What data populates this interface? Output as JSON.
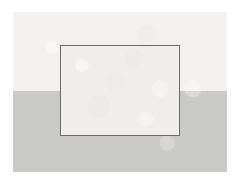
{
  "figure": {
    "canvas": {
      "width": 241,
      "height": 183,
      "background_color": "#ffffff"
    },
    "scene_panel": {
      "name": "scene-panel",
      "x": 13,
      "y": 12,
      "width": 214,
      "height": 160,
      "upper_band": {
        "label": "upper-band",
        "color": "#f2f1f0",
        "height": 79
      },
      "lower_band": {
        "label": "lower-band",
        "color": "#c9c9c7",
        "top": 79,
        "height": 81
      },
      "horizon_y": 91
    },
    "outline_rectangle": {
      "name": "outline-rectangle",
      "x": 60,
      "y": 45,
      "width": 120,
      "height": 91,
      "stroke_color": "#6a6a6a",
      "stroke_width": 1.5,
      "fill_color": "#efeeec"
    }
  }
}
